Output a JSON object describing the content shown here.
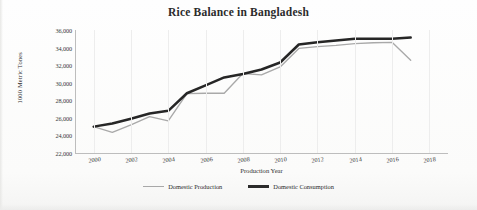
{
  "chart_data": {
    "type": "line",
    "title": "Rice Balance in Bangladesh",
    "xlabel": "Production Year",
    "ylabel": "1000 Metric Tones",
    "x": [
      2000,
      2001,
      2002,
      2003,
      2004,
      2005,
      2006,
      2007,
      2008,
      2009,
      2010,
      2011,
      2012,
      2013,
      2014,
      2015,
      2016,
      2017
    ],
    "xlim": [
      1999,
      2019
    ],
    "ylim": [
      22000,
      36000
    ],
    "ytick_labels": [
      "36,000",
      "34,000",
      "32,000",
      "30,000",
      "28,000",
      "26,000",
      "24,000",
      "22,000"
    ],
    "ytick_values": [
      36000,
      34000,
      32000,
      30000,
      28000,
      26000,
      24000,
      22000
    ],
    "xtick_labels": [
      "2000",
      "2002",
      "2004",
      "2006",
      "2008",
      "2010",
      "2012",
      "2014",
      "2016",
      "2018"
    ],
    "xtick_values": [
      2000,
      2002,
      2004,
      2006,
      2008,
      2010,
      2012,
      2014,
      2016,
      2018
    ],
    "grid": "vertical-only",
    "legend_position": "bottom",
    "series": [
      {
        "name": "Domestic Production",
        "color": "#a9a9a9",
        "style": "thin-line",
        "values": [
          25000,
          24350,
          25200,
          26150,
          25650,
          28750,
          28800,
          28800,
          31050,
          30900,
          31800,
          33900,
          34100,
          34250,
          34450,
          34550,
          34600,
          32550
        ]
      },
      {
        "name": "Domestic Consumption",
        "color": "#262626",
        "style": "thick-line",
        "values": [
          25000,
          25350,
          25900,
          26500,
          26800,
          28800,
          29700,
          30600,
          31000,
          31500,
          32300,
          34350,
          34600,
          34800,
          35000,
          35000,
          35000,
          35150
        ]
      }
    ]
  },
  "legend": {
    "items": [
      {
        "label": "Domestic Production",
        "swatch": "production"
      },
      {
        "label": "Domestic Consumption",
        "swatch": "consumption"
      }
    ]
  }
}
